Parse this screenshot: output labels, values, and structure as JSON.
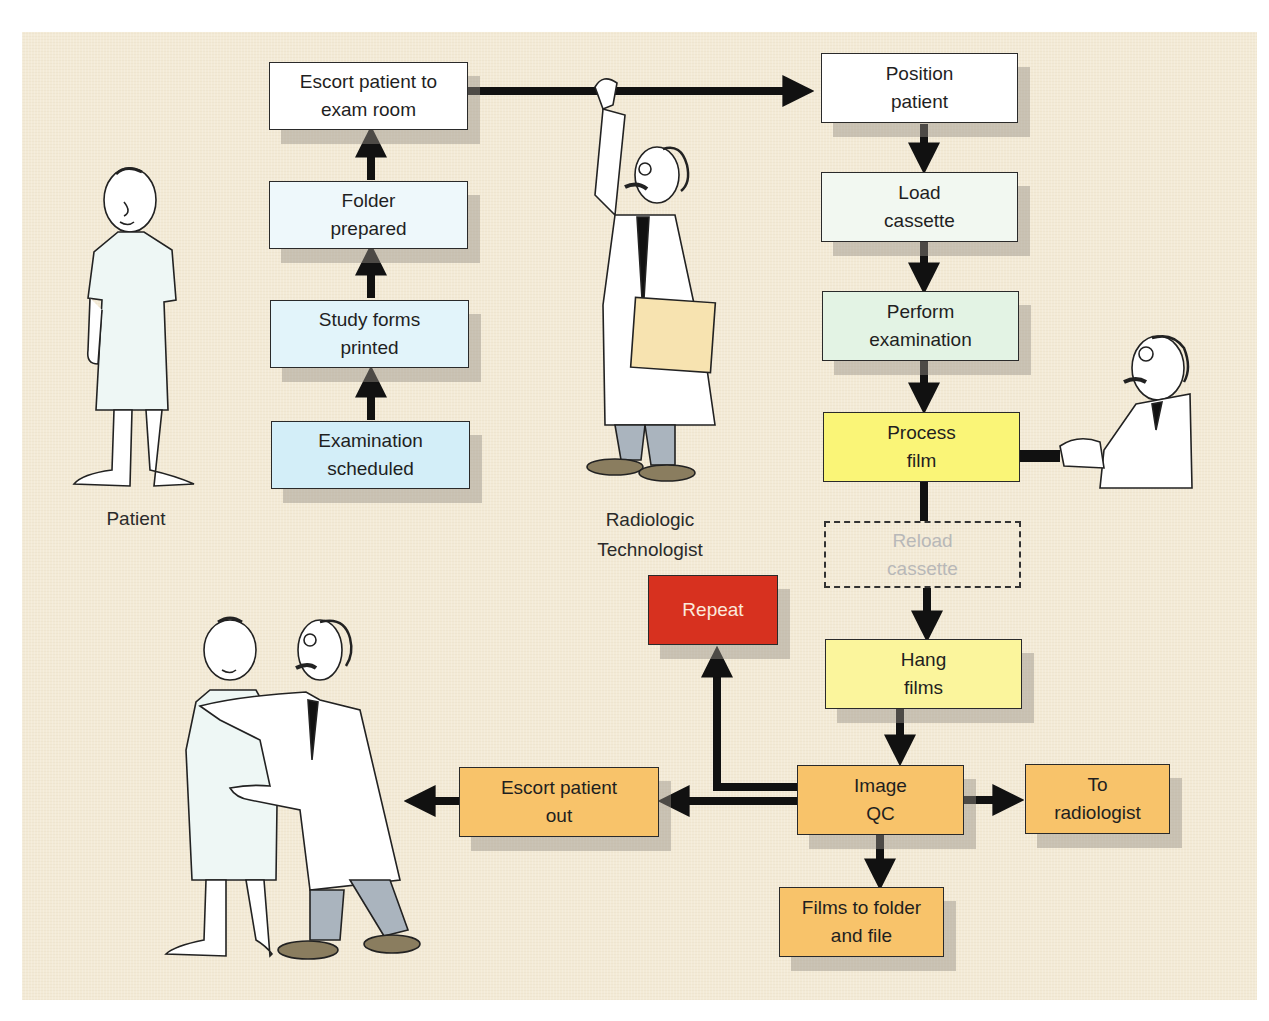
{
  "diagram": {
    "background_color": "#f3ead6",
    "boxes": [
      {
        "id": "escort-to-exam",
        "lines": [
          "Escort patient to",
          "exam room"
        ],
        "color": "#ffffff"
      },
      {
        "id": "folder-prepared",
        "lines": [
          "Folder",
          "prepared"
        ],
        "color": "#eef8fb"
      },
      {
        "id": "study-forms",
        "lines": [
          "Study forms",
          "printed"
        ],
        "color": "#e2f4fa"
      },
      {
        "id": "exam-scheduled",
        "lines": [
          "Examination",
          "scheduled"
        ],
        "color": "#d3eef8"
      },
      {
        "id": "position-patient",
        "lines": [
          "Position",
          "patient"
        ],
        "color": "#ffffff"
      },
      {
        "id": "load-cassette",
        "lines": [
          "Load",
          "cassette"
        ],
        "color": "#f2f8f1"
      },
      {
        "id": "perform-exam",
        "lines": [
          "Perform",
          "examination"
        ],
        "color": "#e3f3e4"
      },
      {
        "id": "process-film",
        "lines": [
          "Process",
          "film"
        ],
        "color": "#faf577"
      },
      {
        "id": "reload-cassette",
        "lines": [
          "Reload",
          "cassette"
        ],
        "color": "transparent",
        "style": "dashed"
      },
      {
        "id": "hang-films",
        "lines": [
          "Hang",
          "films"
        ],
        "color": "#fbf59c"
      },
      {
        "id": "repeat",
        "lines": [
          "Repeat"
        ],
        "color": "#d7311f",
        "text_color": "#fbe9dc"
      },
      {
        "id": "image-qc",
        "lines": [
          "Image",
          "QC"
        ],
        "color": "#f8c36a"
      },
      {
        "id": "escort-out",
        "lines": [
          "Escort patient",
          "out"
        ],
        "color": "#f8c36a"
      },
      {
        "id": "to-radiologist",
        "lines": [
          "To",
          "radiologist"
        ],
        "color": "#f8c36a"
      },
      {
        "id": "films-to-folder",
        "lines": [
          "Films to folder",
          "and file"
        ],
        "color": "#f8c36a"
      }
    ],
    "connections": [
      {
        "from": "exam-scheduled",
        "to": "study-forms"
      },
      {
        "from": "study-forms",
        "to": "folder-prepared"
      },
      {
        "from": "folder-prepared",
        "to": "escort-to-exam"
      },
      {
        "from": "escort-to-exam",
        "to": "position-patient"
      },
      {
        "from": "position-patient",
        "to": "load-cassette"
      },
      {
        "from": "load-cassette",
        "to": "perform-exam"
      },
      {
        "from": "perform-exam",
        "to": "process-film"
      },
      {
        "from": "process-film",
        "to": "reload-cassette",
        "style": "line"
      },
      {
        "from": "reload-cassette",
        "to": "hang-films"
      },
      {
        "from": "hang-films",
        "to": "image-qc"
      },
      {
        "from": "image-qc",
        "to": "repeat"
      },
      {
        "from": "image-qc",
        "to": "escort-out"
      },
      {
        "from": "image-qc",
        "to": "to-radiologist"
      },
      {
        "from": "image-qc",
        "to": "films-to-folder"
      },
      {
        "from": "escort-out",
        "to": "exit-left"
      }
    ],
    "figure_labels": {
      "patient": "Patient",
      "technologist_line1": "Radiologic",
      "technologist_line2": "Technologist"
    },
    "figures": [
      {
        "id": "patient",
        "icon": "patient-in-gown"
      },
      {
        "id": "technologist",
        "icon": "technologist-holding-bar-with-folder"
      },
      {
        "id": "processor-operator",
        "icon": "technologist-at-processor"
      },
      {
        "id": "escort",
        "icon": "technologist-escorting-patient"
      }
    ]
  }
}
